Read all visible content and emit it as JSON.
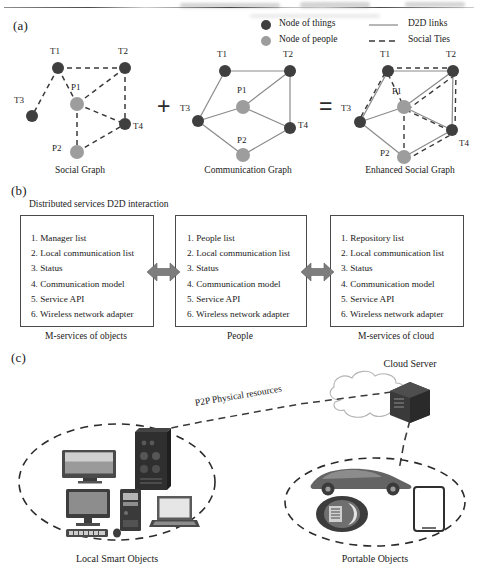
{
  "figure": {
    "panels": [
      {
        "id": "a",
        "label": "(a)"
      },
      {
        "id": "b",
        "label": "(b)"
      },
      {
        "id": "c",
        "label": "(c)"
      }
    ]
  },
  "panel_a": {
    "legend": {
      "items": [
        {
          "swatch": "node-things-swatch",
          "label": "Node of things",
          "color": "#3f3f3f"
        },
        {
          "swatch": "node-people-swatch",
          "label": "Node of people",
          "color": "#9d9d9d"
        },
        {
          "swatch": "d2d-link-swatch",
          "label": "D2D links",
          "style": "solid"
        },
        {
          "swatch": "social-tie-swatch",
          "label": "Social Ties",
          "style": "dashed"
        }
      ]
    },
    "graphs": [
      {
        "name": "social-graph",
        "caption": "Social Graph",
        "nodes": [
          {
            "id": "T1",
            "label": "T1",
            "type": "things"
          },
          {
            "id": "T2",
            "label": "T2",
            "type": "things"
          },
          {
            "id": "T3",
            "label": "T3",
            "type": "things"
          },
          {
            "id": "T4",
            "label": "T4",
            "type": "things"
          },
          {
            "id": "P1",
            "label": "P1",
            "type": "people"
          },
          {
            "id": "P2",
            "label": "P2",
            "type": "people"
          }
        ],
        "edges": [
          {
            "from": "T1",
            "to": "T2",
            "style": "dashed"
          },
          {
            "from": "T1",
            "to": "T3",
            "style": "dashed"
          },
          {
            "from": "T1",
            "to": "P1",
            "style": "dashed"
          },
          {
            "from": "T2",
            "to": "P1",
            "style": "dashed"
          },
          {
            "from": "T2",
            "to": "T4",
            "style": "dashed"
          },
          {
            "from": "P1",
            "to": "T4",
            "style": "dashed"
          },
          {
            "from": "P1",
            "to": "P2",
            "style": "dashed"
          },
          {
            "from": "P2",
            "to": "T4",
            "style": "dashed"
          }
        ]
      },
      {
        "name": "communication-graph",
        "caption": "Communication Graph",
        "nodes": [
          {
            "id": "T1",
            "label": "T1",
            "type": "things"
          },
          {
            "id": "T2",
            "label": "T2",
            "type": "things"
          },
          {
            "id": "T3",
            "label": "T3",
            "type": "things"
          },
          {
            "id": "T4",
            "label": "T4",
            "type": "things"
          },
          {
            "id": "P1",
            "label": "P1",
            "type": "people"
          },
          {
            "id": "P2",
            "label": "P2",
            "type": "people"
          }
        ],
        "edges": [
          {
            "from": "T1",
            "to": "T2",
            "style": "solid"
          },
          {
            "from": "T1",
            "to": "T3",
            "style": "solid"
          },
          {
            "from": "T2",
            "to": "P1",
            "style": "solid"
          },
          {
            "from": "T2",
            "to": "T4",
            "style": "solid"
          },
          {
            "from": "T3",
            "to": "P1",
            "style": "solid"
          },
          {
            "from": "T3",
            "to": "P2",
            "style": "solid"
          },
          {
            "from": "P1",
            "to": "T4",
            "style": "solid"
          },
          {
            "from": "P2",
            "to": "T4",
            "style": "solid"
          }
        ]
      },
      {
        "name": "enhanced-social-graph",
        "caption": "Enhanced Social Graph",
        "nodes": [
          {
            "id": "T1",
            "label": "T1",
            "type": "things"
          },
          {
            "id": "T2",
            "label": "T2",
            "type": "things"
          },
          {
            "id": "T3",
            "label": "T3",
            "type": "things"
          },
          {
            "id": "T4",
            "label": "T4",
            "type": "things"
          },
          {
            "id": "P1",
            "label": "P1",
            "type": "people"
          },
          {
            "id": "P2",
            "label": "P2",
            "type": "people"
          }
        ]
      }
    ],
    "operators": [
      {
        "name": "plus-operator",
        "symbol": "+"
      },
      {
        "name": "equals-operator",
        "symbol": "="
      }
    ]
  },
  "panel_b": {
    "heading": "Distributed services D2D interaction",
    "columns": [
      {
        "name": "m-services-of-objects",
        "caption": "M-services of objects",
        "items": [
          "1. Manager list",
          "2. Local communication list",
          "3. Status",
          "4. Communication model",
          "5. Service API",
          "6. Wireless network adapter"
        ]
      },
      {
        "name": "people",
        "caption": "People",
        "items": [
          "1. People list",
          "2. Local communication list",
          "3. Status",
          "4. Communication model",
          "5. Service API",
          "6. Wireless network adapter"
        ]
      },
      {
        "name": "m-services-of-cloud",
        "caption": "M-services of cloud",
        "items": [
          "1. Repository list",
          "2. Local communication list",
          "3. Status",
          "4. Communication model",
          "5. Service API",
          "6. Wireless network adapter"
        ]
      }
    ],
    "connectors": [
      {
        "name": "bidirectional-arrow-left",
        "color": "#7d7d7d"
      },
      {
        "name": "bidirectional-arrow-right",
        "color": "#7d7d7d"
      }
    ]
  },
  "panel_c": {
    "cloud_server_label": "Cloud Server",
    "link_label": "P2P Physical resources",
    "groups": [
      {
        "name": "local-smart-objects",
        "caption": "Local Smart Objects",
        "devices": [
          "tv-icon",
          "server-tower-icon",
          "desktop-monitor-icon",
          "keyboard-icon",
          "mouse-icon",
          "pc-tower-icon",
          "laptop-icon"
        ]
      },
      {
        "name": "portable-objects",
        "caption": "Portable Objects",
        "devices": [
          "car-icon",
          "smartwatch-icon",
          "tablet-icon"
        ]
      }
    ]
  }
}
